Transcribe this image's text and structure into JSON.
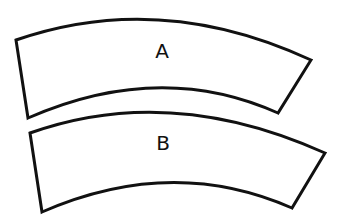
{
  "diagram": {
    "shapes": [
      {
        "id": "A",
        "label": "A",
        "kind": "annular-sector"
      },
      {
        "id": "B",
        "label": "B",
        "kind": "annular-sector"
      }
    ],
    "colors": {
      "stroke": "#111111",
      "fill": "#ffffff",
      "background": "#ffffff"
    }
  }
}
